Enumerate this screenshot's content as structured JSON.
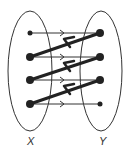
{
  "diagram": {
    "sets": [
      {
        "id": "X",
        "label": "X",
        "cx": 30,
        "cy": 71,
        "rx": 22,
        "ry": 60
      },
      {
        "id": "Y",
        "label": "Y",
        "cx": 101,
        "cy": 71,
        "rx": 21,
        "ry": 60
      }
    ],
    "points": {
      "X": [
        {
          "x": 30,
          "y": 33,
          "r": 2.5
        },
        {
          "x": 30,
          "y": 57,
          "r": 4
        },
        {
          "x": 30,
          "y": 80,
          "r": 4
        },
        {
          "x": 30,
          "y": 104,
          "r": 4
        }
      ],
      "Y": [
        {
          "x": 100,
          "y": 33,
          "r": 4
        },
        {
          "x": 100,
          "y": 57,
          "r": 4
        },
        {
          "x": 100,
          "y": 80,
          "r": 4
        },
        {
          "x": 100,
          "y": 104,
          "r": 2.5
        }
      ]
    },
    "edges": [
      {
        "from": "X1",
        "to": "Y1",
        "style": "thin",
        "direction": "X->Y"
      },
      {
        "from": "X2",
        "to": "Y2",
        "style": "thin",
        "direction": "X->Y"
      },
      {
        "from": "X3",
        "to": "Y3",
        "style": "thin",
        "direction": "X->Y"
      },
      {
        "from": "X4",
        "to": "Y4",
        "style": "thin",
        "direction": "X->Y"
      },
      {
        "from": "Y1",
        "to": "X2",
        "style": "thick",
        "direction": "Y->X"
      },
      {
        "from": "Y2",
        "to": "X3",
        "style": "thick",
        "direction": "Y->X"
      },
      {
        "from": "Y3",
        "to": "X4",
        "style": "thick",
        "direction": "Y->X"
      }
    ],
    "labels": {
      "x": "X",
      "y": "Y"
    }
  }
}
